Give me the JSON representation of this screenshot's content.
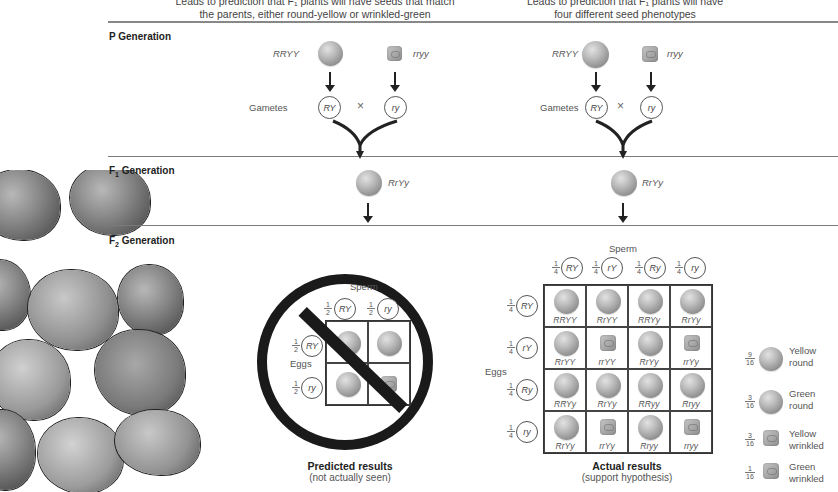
{
  "hypotheses": {
    "left": {
      "line1": "Leads to prediction that F₁ plants will have seeds that match",
      "line2": "the parents, either round-yellow or wrinkled-green"
    },
    "right": {
      "line1": "Leads to prediction that F₁ plants will have",
      "line2": "four different seed phenotypes"
    }
  },
  "generations": {
    "p": "P Generation",
    "f1_main": "F",
    "f1_sub": "1",
    "f1_rest": " Generation",
    "f2_main": "F",
    "f2_sub": "2",
    "f2_rest": " Generation"
  },
  "p_cross": {
    "parent1_genotype": "RRYY",
    "parent2_genotype": "rryy",
    "gametes_label": "Gametes",
    "gamete1": "RY",
    "gamete2": "ry",
    "cross_symbol": "×"
  },
  "f1": {
    "genotype": "RrYy"
  },
  "predicted": {
    "sperm_label": "Sperm",
    "eggs_label": "Eggs",
    "frac_num": "1",
    "frac_den": "2",
    "sperm": [
      "RY",
      "ry"
    ],
    "eggs": [
      "RY",
      "ry"
    ],
    "title": "Predicted results",
    "subtitle": "(not actually seen)"
  },
  "actual": {
    "sperm_label": "Sperm",
    "eggs_label": "Eggs",
    "frac_num": "1",
    "frac_den": "4",
    "sperm": [
      "RY",
      "rY",
      "Ry",
      "ry"
    ],
    "eggs": [
      "RY",
      "rY",
      "Ry",
      "ry"
    ],
    "rows": [
      [
        "RRYY",
        "RrYY",
        "RRYy",
        "RrYy"
      ],
      [
        "RrYY",
        "rrYY",
        "RrYy",
        "rrYy"
      ],
      [
        "RRYy",
        "RrYy",
        "RRyy",
        "Rryy"
      ],
      [
        "RrYy",
        "rrYy",
        "Rryy",
        "rryy"
      ]
    ],
    "title": "Actual results",
    "subtitle": "(support hypothesis)"
  },
  "phenotype_ratios": [
    {
      "num": "9",
      "den": "16",
      "line1": "Yellow",
      "line2": "round",
      "shape": "round"
    },
    {
      "num": "3",
      "den": "16",
      "line1": "Green",
      "line2": "round",
      "shape": "round"
    },
    {
      "num": "3",
      "den": "16",
      "line1": "Yellow",
      "line2": "wrinkled",
      "shape": "wrinkled"
    },
    {
      "num": "1",
      "den": "16",
      "line1": "Green",
      "line2": "wrinkled",
      "shape": "wrinkled"
    }
  ]
}
